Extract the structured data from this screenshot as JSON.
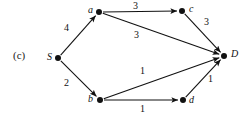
{
  "figure": {
    "panel_label": "(c)",
    "panel_label_pos": {
      "x": 13,
      "y": 50
    }
  },
  "chart_data": {
    "type": "diagram",
    "subtype": "directed-weighted-graph",
    "title": "(c)",
    "nodes": [
      {
        "id": "S",
        "label": "S",
        "x": 58,
        "y": 58,
        "label_x": 47,
        "label_y": 52
      },
      {
        "id": "a",
        "label": "a",
        "x": 99,
        "y": 12,
        "label_x": 88,
        "label_y": 5
      },
      {
        "id": "b",
        "label": "b",
        "x": 100,
        "y": 100,
        "label_x": 88,
        "label_y": 94
      },
      {
        "id": "c",
        "label": "c",
        "x": 182,
        "y": 11,
        "label_x": 189,
        "label_y": 4
      },
      {
        "id": "d",
        "label": "d",
        "x": 183,
        "y": 100,
        "label_x": 189,
        "label_y": 95
      },
      {
        "id": "D",
        "label": "D",
        "x": 224,
        "y": 56,
        "label_x": 231,
        "label_y": 49
      }
    ],
    "edges": [
      {
        "from": "S",
        "to": "a",
        "weight": "4",
        "label_x": 64,
        "label_y": 23
      },
      {
        "from": "S",
        "to": "b",
        "weight": "2",
        "label_x": 64,
        "label_y": 78
      },
      {
        "from": "a",
        "to": "c",
        "weight": "3",
        "label_x": 133,
        "label_y": 1
      },
      {
        "from": "a",
        "to": "D",
        "weight": "3",
        "label_x": 134,
        "label_y": 30
      },
      {
        "from": "c",
        "to": "D",
        "weight": "3",
        "label_x": 204,
        "label_y": 17
      },
      {
        "from": "b",
        "to": "D",
        "weight": "1",
        "label_x": 140,
        "label_y": 66
      },
      {
        "from": "b",
        "to": "d",
        "weight": "1",
        "label_x": 140,
        "label_y": 104
      },
      {
        "from": "d",
        "to": "D",
        "weight": "1",
        "label_x": 208,
        "label_y": 74
      }
    ],
    "node_radius": 3,
    "edge_color": "#111111",
    "node_color": "#111111"
  }
}
